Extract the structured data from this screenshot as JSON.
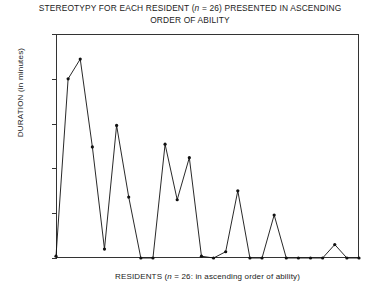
{
  "chart_data": {
    "type": "line",
    "title": "STEREOTYPY FOR EACH RESIDENT (n = 26) PRESENTED IN ASCENDING ORDER OF ABILITY",
    "title_line1": "STEREOTYPY FOR EACH RESIDENT (n = 26) PRESENTED IN ASCENDING",
    "title_line2": "ORDER OF ABILITY",
    "title_part_a": "STEREOTYPY FOR EACH RESIDENT (",
    "title_italic_n": "n",
    "title_part_b": " = 26) PRESENTED IN ASCENDING",
    "title_part_c": "ORDER OF ABILITY",
    "xlabel": "RESIDENTS (n = 26: in ascending order of ability)",
    "xlabel_part_a": "RESIDENTS (",
    "xlabel_italic_n": "n",
    "xlabel_part_b": " = 26: in ascending order of ability)",
    "ylabel": "DURATION (in minutes)",
    "ylim": [
      0,
      250
    ],
    "ytick_values": [
      250,
      200,
      150,
      100,
      50,
      0
    ],
    "ytick_labels": [
      "250",
      "200",
      "150",
      "100",
      "50",
      "0"
    ],
    "xlim": [
      1,
      26
    ],
    "xtick_labels": [],
    "grid": false,
    "legend": false,
    "marker": "dot",
    "line_color": "#111111",
    "x": [
      1,
      2,
      3,
      4,
      5,
      6,
      7,
      8,
      9,
      10,
      11,
      12,
      13,
      14,
      15,
      16,
      17,
      18,
      19,
      20,
      21,
      22,
      23,
      24,
      25,
      26
    ],
    "values": [
      2,
      200,
      222,
      124,
      10,
      148,
      68,
      0,
      0,
      127,
      65,
      112,
      2,
      0,
      7,
      75,
      0,
      0,
      48,
      0,
      0,
      0,
      0,
      15,
      0,
      0
    ],
    "series": [
      {
        "name": "Stereotypy duration",
        "values": [
          2,
          200,
          222,
          124,
          10,
          148,
          68,
          0,
          0,
          127,
          65,
          112,
          2,
          0,
          7,
          75,
          0,
          0,
          48,
          0,
          0,
          0,
          0,
          15,
          0,
          0
        ]
      }
    ]
  }
}
